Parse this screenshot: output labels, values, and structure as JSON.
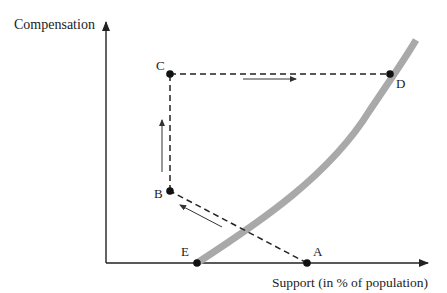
{
  "axes": {
    "y_label": "Compensation",
    "x_label": "Support (in % of population)"
  },
  "points": [
    {
      "id": "A",
      "label": "A"
    },
    {
      "id": "B",
      "label": "B"
    },
    {
      "id": "C",
      "label": "C"
    },
    {
      "id": "D",
      "label": "D"
    },
    {
      "id": "E",
      "label": "E"
    }
  ],
  "path": [
    "A",
    "B",
    "C",
    "D"
  ],
  "curve": {
    "description": "threshold curve from E through D",
    "color": "#a9a9a9"
  },
  "colors": {
    "axis": "#222222",
    "curve": "#a9a9a9",
    "dashed": "#222222",
    "point": "#111111"
  }
}
